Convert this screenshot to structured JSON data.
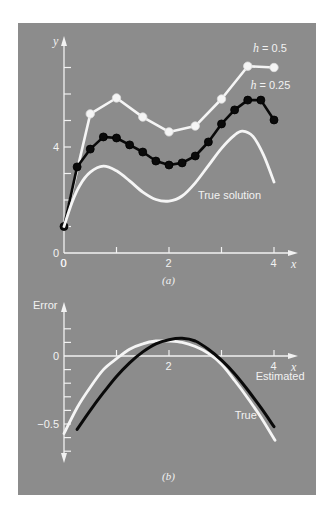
{
  "figure": {
    "panel_color": "#8c8c8c",
    "line_white": "#f5f5f5",
    "line_black": "#0a0a0a"
  },
  "chart_data": [
    {
      "id": "a",
      "type": "line",
      "caption": "(a)",
      "xlabel": "x",
      "ylabel": "y",
      "xlim": [
        0,
        4.3
      ],
      "ylim": [
        0,
        7.8
      ],
      "x_ticks": [
        0,
        1,
        2,
        3,
        4
      ],
      "x_tick_labels": [
        "0",
        "",
        "2",
        "",
        "4"
      ],
      "y_ticks": [
        1,
        2,
        3,
        4,
        5,
        6,
        7
      ],
      "y_tick_labels": [
        {
          "value": 0,
          "label": "0"
        },
        {
          "value": 4,
          "label": "4"
        }
      ],
      "grid": false,
      "series": [
        {
          "name": "h = 0.5",
          "color": "#f5f5f5",
          "markers": true,
          "x": [
            0,
            0.5,
            1.0,
            1.5,
            2.0,
            2.5,
            3.0,
            3.5,
            4.0
          ],
          "y": [
            1.0,
            5.25,
            5.85,
            5.13,
            4.57,
            4.79,
            5.81,
            7.05,
            7.0
          ],
          "label": "h = 0.5",
          "label_pos": [
            3.6,
            7.6
          ]
        },
        {
          "name": "h = 0.25",
          "color": "#0a0a0a",
          "markers": true,
          "x": [
            0,
            0.25,
            0.5,
            0.75,
            1.0,
            1.25,
            1.5,
            1.75,
            2.0,
            2.25,
            2.5,
            2.75,
            3.0,
            3.25,
            3.5,
            3.75,
            4.0
          ],
          "y": [
            1.0,
            3.25,
            3.92,
            4.38,
            4.34,
            4.08,
            3.81,
            3.47,
            3.32,
            3.4,
            3.66,
            4.19,
            4.87,
            5.4,
            5.77,
            5.77,
            5.02
          ],
          "label": "h = 0.25",
          "label_pos": [
            3.55,
            6.2
          ]
        },
        {
          "name": "True solution",
          "color": "#f5f5f5",
          "markers": false,
          "x": [
            0,
            0.15,
            0.3,
            0.5,
            0.75,
            1.0,
            1.25,
            1.5,
            1.75,
            2.0,
            2.25,
            2.5,
            2.75,
            3.0,
            3.25,
            3.4,
            3.6,
            3.8,
            4.0
          ],
          "y": [
            1.0,
            1.9,
            2.55,
            3.05,
            3.28,
            3.1,
            2.72,
            2.3,
            2.02,
            1.96,
            2.15,
            2.65,
            3.3,
            3.95,
            4.45,
            4.6,
            4.4,
            3.7,
            2.68
          ],
          "label": "True solution",
          "label_pos": [
            2.55,
            2.05
          ]
        }
      ]
    },
    {
      "id": "b",
      "type": "line",
      "caption": "(b)",
      "xlabel": "x",
      "ylabel": "Error",
      "xlim": [
        0,
        4.3
      ],
      "ylim": [
        -0.77,
        0.38
      ],
      "x_ticks": [
        1,
        2,
        3,
        4
      ],
      "x_tick_labels": [
        "",
        "2",
        "",
        "4"
      ],
      "y_ticks": [
        0.2,
        0.1,
        0,
        -0.1,
        -0.2,
        -0.3,
        -0.4,
        -0.5,
        -0.6,
        -0.7
      ],
      "y_tick_labels": [
        {
          "value": 0,
          "label": "0"
        },
        {
          "value": -0.5,
          "label": "−0.5"
        }
      ],
      "grid": false,
      "series": [
        {
          "name": "True",
          "color": "#f5f5f5",
          "markers": false,
          "x": [
            0,
            0.25,
            0.5,
            0.75,
            1.0,
            1.25,
            1.5,
            1.75,
            2.0,
            2.25,
            2.5,
            2.75,
            3.0,
            3.25,
            3.5,
            3.75,
            4.02
          ],
          "y": [
            -0.57,
            -0.38,
            -0.23,
            -0.1,
            -0.02,
            0.05,
            0.09,
            0.11,
            0.11,
            0.1,
            0.07,
            0.02,
            -0.06,
            -0.18,
            -0.31,
            -0.45,
            -0.62
          ],
          "label": "True",
          "label_pos": [
            3.25,
            -0.46
          ]
        },
        {
          "name": "Estimated",
          "color": "#0a0a0a",
          "markers": false,
          "x": [
            0.25,
            0.5,
            0.75,
            1.0,
            1.25,
            1.5,
            1.75,
            2.0,
            2.25,
            2.5,
            2.75,
            3.0,
            3.25,
            3.5,
            3.75,
            4.0
          ],
          "y": [
            -0.54,
            -0.4,
            -0.27,
            -0.15,
            -0.05,
            0.03,
            0.09,
            0.12,
            0.13,
            0.11,
            0.05,
            -0.03,
            -0.13,
            -0.25,
            -0.38,
            -0.52
          ],
          "label": "Estimated",
          "label_pos": [
            3.65,
            -0.18
          ]
        }
      ]
    }
  ]
}
